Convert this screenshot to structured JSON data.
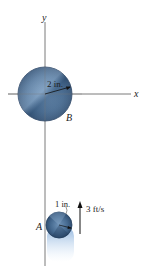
{
  "figure": {
    "axes": {
      "x_label": "x",
      "y_label": "y"
    },
    "disk_b": {
      "label": "B",
      "radius_label": "2 in."
    },
    "disk_a": {
      "label": "A",
      "radius_label": "1 in."
    },
    "velocity": {
      "label": "3 ft/s",
      "direction": "up"
    },
    "colors": {
      "disk_fill": "#4a6f96",
      "disk_dark": "#2f4d70",
      "disk_light": "#8fb0cf",
      "axis": "#7a7a7a",
      "blur": "#9cc2ea"
    }
  }
}
